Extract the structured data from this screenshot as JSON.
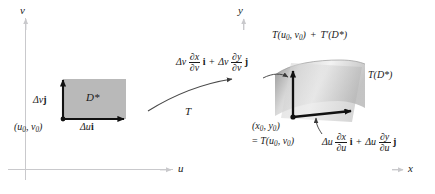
{
  "figure": {
    "domain_panel": {
      "axis_v_label": "v",
      "axis_u_label": "u",
      "region_label": "D*",
      "corner_point_label": "(u0, v0)",
      "vertical_vector_label": "Δv j",
      "horizontal_vector_label": "Δu i",
      "region_fill": "#b9b9b9"
    },
    "map_arrow": {
      "label": "T"
    },
    "range_panel": {
      "axis_y_label": "y",
      "axis_x_label": "x",
      "tangent_plane_label": "T(u0, v0) + T'(D*)",
      "image_label": "T(D*)",
      "base_point_line1": "(x0, y0)",
      "base_point_line2": "= T(u0, v0)",
      "v_vector_label": "Δv ∂x/∂v i + Δv ∂y/∂v j",
      "u_vector_label": "Δu ∂x/∂u i + Δu ∂y/∂u j",
      "surface_fill": "#b9b9b9"
    },
    "colors": {
      "axis": "#c9c9cc",
      "vector": "#111111",
      "text": "#1a1a1a"
    }
  }
}
